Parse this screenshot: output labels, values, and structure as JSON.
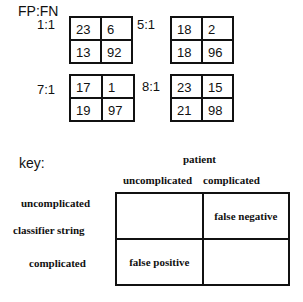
{
  "title": "FP:FN",
  "matrices": [
    {
      "ratio": "1:1",
      "cells": [
        "23",
        "6",
        "13",
        "92"
      ]
    },
    {
      "ratio": "5:1",
      "cells": [
        "18",
        "2",
        "18",
        "96"
      ]
    },
    {
      "ratio": "7:1",
      "cells": [
        "17",
        "1",
        "19",
        "97"
      ]
    },
    {
      "ratio": "8:1",
      "cells": [
        "23",
        "15",
        "21",
        "98"
      ]
    }
  ],
  "key": {
    "label": "key:",
    "column_header": "patient",
    "columns": [
      "uncomplicated",
      "complicated"
    ],
    "row_header": "classifier string",
    "rows": [
      "uncomplicated",
      "complicated"
    ],
    "cells": [
      "",
      "false negative",
      "false positive",
      ""
    ]
  }
}
